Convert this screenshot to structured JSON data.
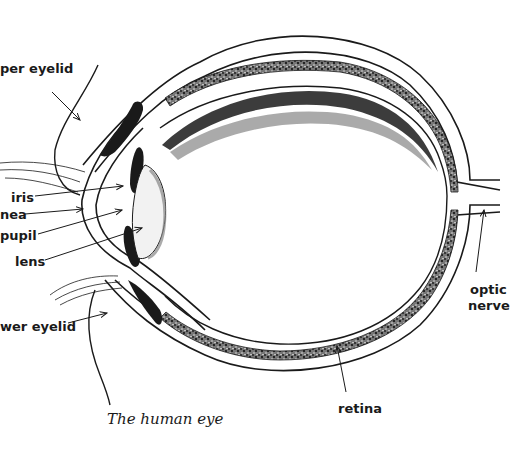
{
  "diagram": {
    "type": "anatomical-cross-section",
    "subject": "human eye",
    "caption": "The human eye",
    "labels": {
      "upper_eyelid": "per eyelid",
      "iris": "iris",
      "cornea": "nea",
      "pupil": "pupil",
      "lens": "lens",
      "lower_eyelid": "wer eyelid",
      "optic_nerve_line1": "optic",
      "optic_nerve_line2": "nerve",
      "retina": "retina"
    },
    "colors": {
      "ink": "#1a1a1a",
      "background": "#ffffff"
    }
  }
}
